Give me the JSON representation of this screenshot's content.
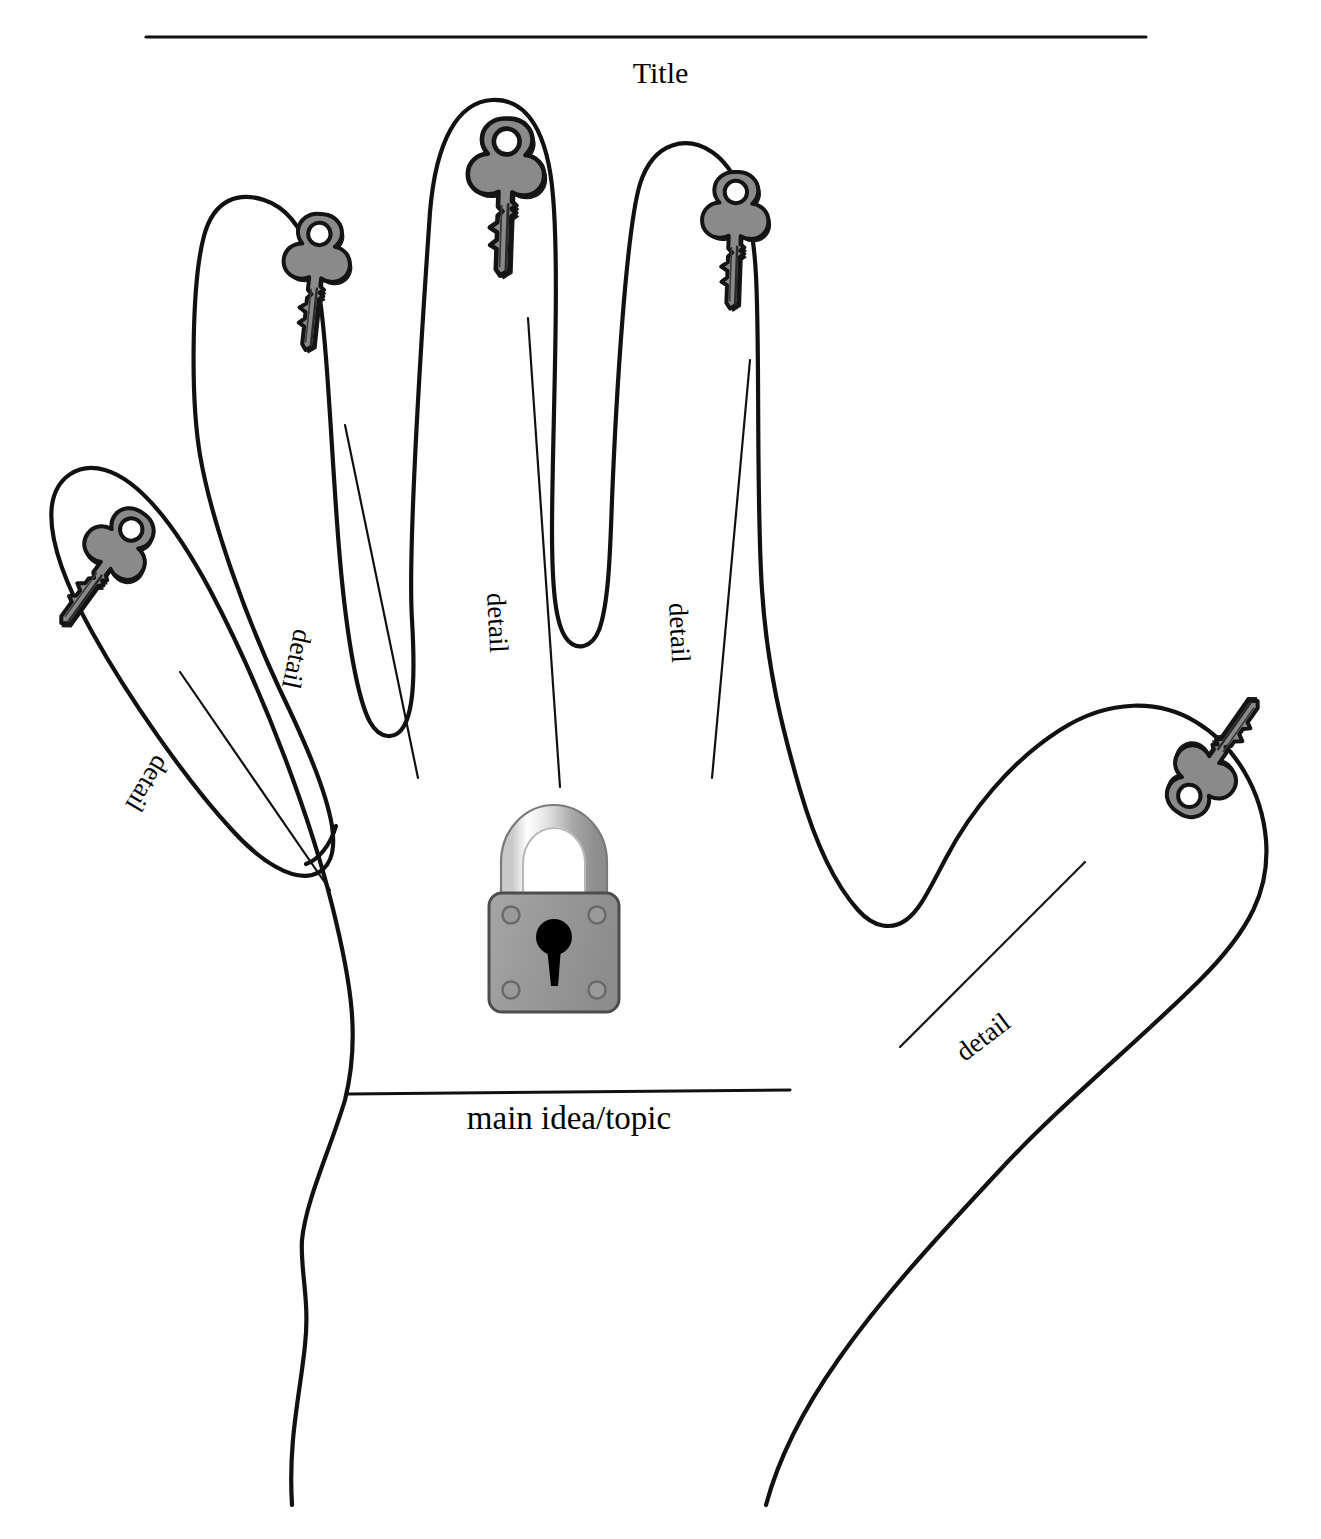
{
  "worksheet": {
    "type": "graphic-organizer",
    "shape": "hand-outline",
    "title_label": "Title",
    "main_idea_label": "main idea/topic",
    "detail_labels": [
      {
        "id": "pinky",
        "text": "detail"
      },
      {
        "id": "index",
        "text": "detail"
      },
      {
        "id": "middle",
        "text": "detail"
      },
      {
        "id": "ring",
        "text": "detail"
      },
      {
        "id": "thumb",
        "text": "detail"
      }
    ],
    "icons": {
      "padlock": "padlock-icon",
      "key": "key-icon"
    },
    "counts": {
      "keys": 5,
      "padlocks": 1,
      "detail_lines": 5
    },
    "colors": {
      "outline": "#111111",
      "key_fill": "#8a8a8a",
      "key_outline": "#1a1a1a",
      "lock_body": "#9a9a9a",
      "lock_shackle_light": "#f2f2f2",
      "lock_shackle_dark": "#8f8f8f",
      "keyhole": "#000000",
      "background": "#ffffff"
    }
  }
}
